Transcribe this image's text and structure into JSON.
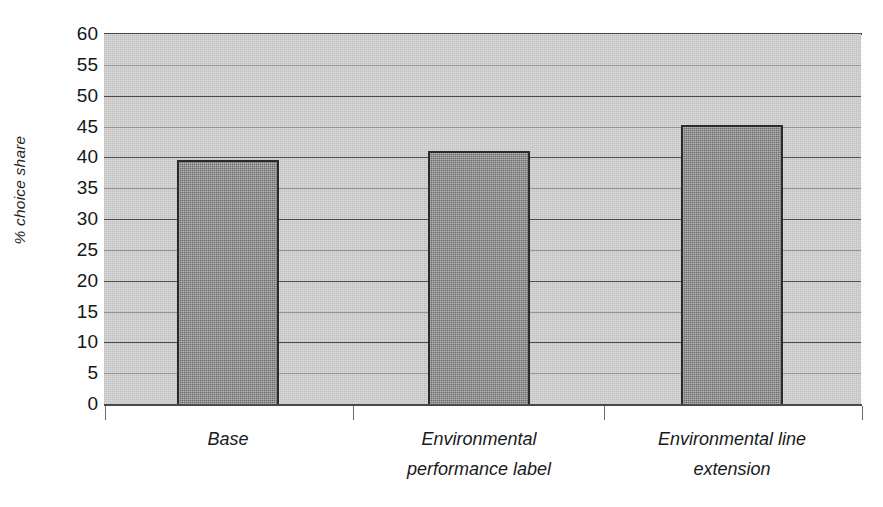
{
  "chart_data": {
    "type": "bar",
    "title": "",
    "subtitle": "",
    "xlabel": "",
    "ylabel": "% choice share",
    "categories": [
      "Base",
      "Environmental performance label",
      "Environmental line extension"
    ],
    "category_lines": [
      [
        "Base"
      ],
      [
        "Environmental",
        "performance label"
      ],
      [
        "Environmental line",
        "extension"
      ]
    ],
    "values": [
      39.5,
      41,
      45.3
    ],
    "ylim": [
      0,
      60
    ],
    "ytick_labels": [
      "60",
      "55",
      "50",
      "45",
      "40",
      "35",
      "30",
      "25",
      "20",
      "15",
      "10",
      "5",
      "0"
    ],
    "ytick_values": [
      60,
      55,
      50,
      45,
      40,
      35,
      30,
      25,
      20,
      15,
      10,
      5,
      0
    ],
    "ytick_step": 5,
    "grid": true,
    "grid_orientation": "horizontal",
    "legend": false,
    "legend_position": "none",
    "series": [
      {
        "name": "% choice share",
        "values": [
          39.5,
          41,
          45.3
        ]
      }
    ],
    "colors": {
      "bar_fill": "#8b8b8b",
      "bar_border": "#2b2b2b",
      "plot_background": "#d9d9d9",
      "gridline": "#4c4c4c",
      "axis": "#4a4a4a",
      "text": "#1a1a1a",
      "page_background": "#ffffff"
    }
  },
  "axes": {
    "y_title": "% choice share",
    "y_title_rotation": "-90"
  }
}
